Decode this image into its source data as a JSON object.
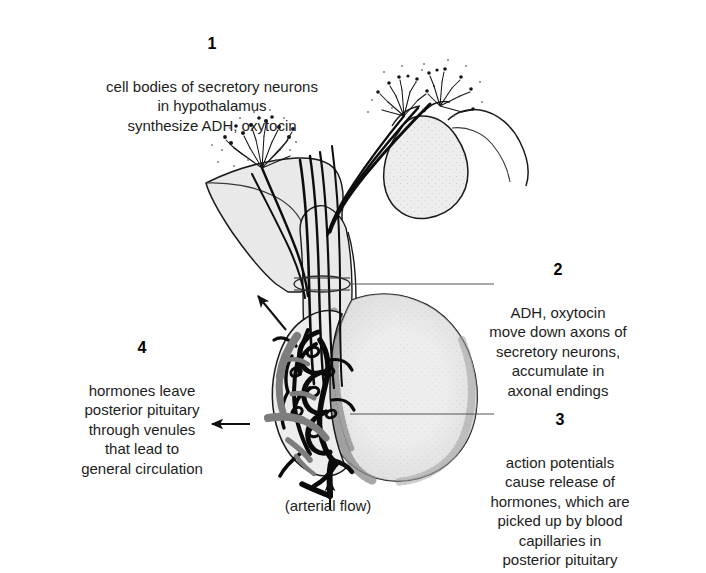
{
  "figure": {
    "background_color": "#ffffff",
    "text_color": "#1d1d1d"
  },
  "callouts": [
    {
      "number": "1",
      "text": "cell bodies of secretory neurons\nin hypothalamus\nsynthesize ADH, oxytocin"
    },
    {
      "number": "2",
      "text": "ADH, oxytocin\nmove down axons of\nsecretory neurons,\naccumulate in\naxonal endings"
    },
    {
      "number": "3",
      "text": "action potentials\ncause release of\nhormones, which are\npicked up by blood\ncapillaries in\nposterior pituitary"
    },
    {
      "number": "4",
      "text": "hormones leave\nposterior pituitary\nthrough venules\nthat lead to\ngeneral circulation"
    }
  ],
  "caption": {
    "arterial_flow": "(arterial flow)"
  },
  "anatomy": {
    "structures": [
      {
        "name": "hypothalamus",
        "fill": "#e9e9e9",
        "stroke": "#1a1a1a"
      },
      {
        "name": "infundibulum-stalk",
        "fill": "#e9e9e9",
        "stroke": "#1a1a1a"
      },
      {
        "name": "posterior-pituitary",
        "fill": "#ededed",
        "stroke": "#1a1a1a"
      },
      {
        "name": "anterior-pituitary",
        "fill": "#e7e7e7",
        "stroke": "#1a1a1a"
      },
      {
        "name": "optic-chiasm",
        "fill": "#e9e9e9",
        "stroke": "#1a1a1a"
      },
      {
        "name": "neuron-cell-body-tufts",
        "stroke": "#151515"
      },
      {
        "name": "axon-bundle",
        "stroke": "#0d0d0d"
      },
      {
        "name": "capillary-plexus",
        "stroke": "#0a0a0a"
      },
      {
        "name": "venule",
        "stroke": "#7d7d7d"
      },
      {
        "name": "arteriole",
        "stroke": "#0a0a0a"
      }
    ],
    "leader_line_color": "#555555",
    "arrow_color": "#111111"
  }
}
